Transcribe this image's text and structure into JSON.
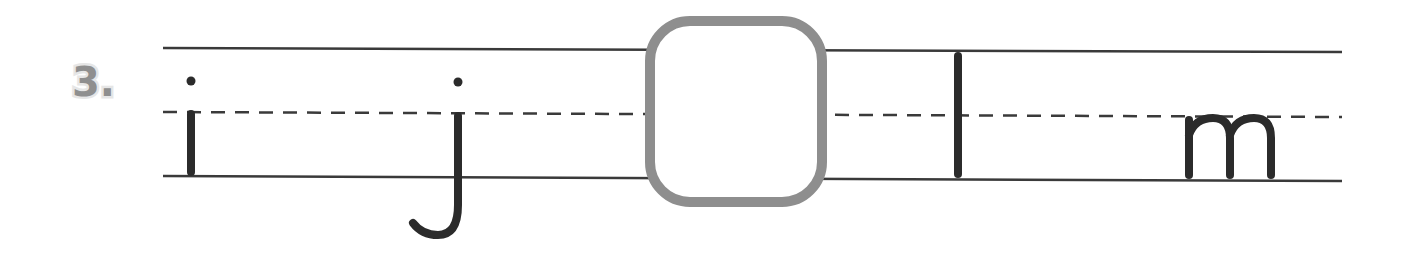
{
  "exercise": {
    "number_label": "3.",
    "sequence": [
      "i",
      "j",
      "",
      "l",
      "m"
    ],
    "blank_index": 2,
    "answer_box": {
      "border_color": "#8e8e8e"
    }
  },
  "colors": {
    "ink": "#2b2b2b",
    "lines": "#3a3a3a",
    "number": "#8f8f8f"
  }
}
